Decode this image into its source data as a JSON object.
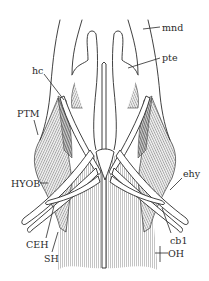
{
  "figure": {
    "type": "anatomical line drawing",
    "view": "ventral view of head musculature",
    "colors": {
      "background": "#ffffff",
      "line": "#2b2b2b",
      "muscle_fill": "#d8d8d8",
      "muscle_shade": "#a9a9a9"
    }
  },
  "labels": {
    "mnd": "mnd",
    "pte": "pte",
    "hc": "hc",
    "PTM": "PTM",
    "HYOB": "HYOB",
    "ehy": "ehy",
    "CEH": "CEH",
    "SH": "SH",
    "cb1": "cb1",
    "OH": "OH"
  }
}
